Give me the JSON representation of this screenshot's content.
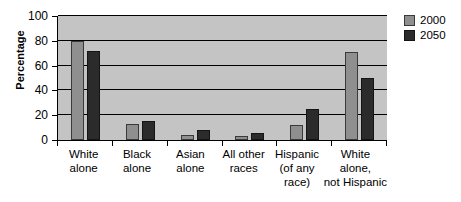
{
  "chart_data": {
    "type": "bar",
    "title": "",
    "xlabel": "",
    "ylabel": "Percentage",
    "ylim": [
      0,
      100
    ],
    "yticks": [
      0,
      20,
      40,
      60,
      80,
      100
    ],
    "grid": true,
    "legend_position": "right",
    "categories": [
      "White alone",
      "Black alone",
      "Asian alone",
      "All other races",
      "Hispanic (of any race)",
      "White alone, not Hispanic"
    ],
    "category_lines": [
      [
        "White",
        "alone"
      ],
      [
        "Black",
        "alone"
      ],
      [
        "Asian",
        "alone"
      ],
      [
        "All other",
        "races"
      ],
      [
        "Hispanic",
        "(of any",
        "race)"
      ],
      [
        "White",
        "alone,",
        "not Hispanic"
      ]
    ],
    "series": [
      {
        "name": "2000",
        "color": "#8f8f8f",
        "values": [
          80,
          13,
          4,
          3,
          12,
          71
        ]
      },
      {
        "name": "2050",
        "color": "#2b2b2b",
        "values": [
          72,
          15,
          8,
          6,
          25,
          50
        ]
      }
    ]
  },
  "legend": {
    "items": [
      {
        "label": "2000"
      },
      {
        "label": "2050"
      }
    ]
  }
}
